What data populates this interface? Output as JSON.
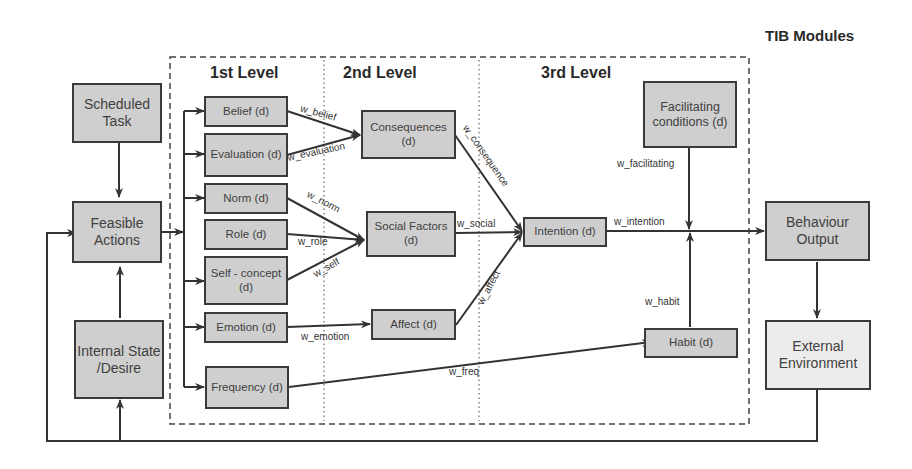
{
  "diagram": {
    "module_title": "TIB Modules",
    "levels": [
      "1st Level",
      "2nd Level",
      "3rd Level"
    ],
    "external_nodes": {
      "scheduled_task": "Scheduled Task",
      "feasible_actions": "Feasible Actions",
      "internal_state": "Internal State /Desire",
      "behaviour_output": "Behaviour Output",
      "external_environment": "External Environment"
    },
    "first_level": {
      "belief": "Belief (d)",
      "evaluation": "Evaluation (d)",
      "norm": "Norm (d)",
      "role": "Role (d)",
      "self_concept": "Self - concept (d)",
      "emotion": "Emotion (d)",
      "frequency": "Frequency (d)"
    },
    "second_level": {
      "consequences": "Consequences (d)",
      "social_factors": "Social Factors (d)",
      "affect": "Affect (d)"
    },
    "third_level": {
      "intention": "Intention (d)",
      "facilitating": "Facilitating conditions (d)",
      "habit": "Habit (d)"
    },
    "weights": {
      "w_belief": "w_belief",
      "w_evaluation": "w_evaluation",
      "w_norm": "w_norm",
      "w_role": "w_role",
      "w_self": "w_self",
      "w_emotion": "w_emotion",
      "w_freq": "w_freq",
      "w_consequence": "w_consequence",
      "w_social": "w_social",
      "w_affect": "w_affect",
      "w_intention": "w_intention",
      "w_facilitating": "w_facilitating",
      "w_habit": "w_habit"
    },
    "colors": {
      "node_fill": "#cfcfcf",
      "env_fill": "#ececec",
      "stroke": "#3a3a3a"
    }
  }
}
